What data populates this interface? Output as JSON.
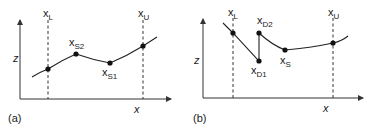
{
  "figure": {
    "panels": [
      {
        "id": "a",
        "caption": "(a)",
        "axis_y_label": "z",
        "axis_x_label": "x",
        "bounds": {
          "lower": {
            "base": "x",
            "sub": "L"
          },
          "upper": {
            "base": "x",
            "sub": "U"
          }
        },
        "points": [
          {
            "base": "x",
            "sub": "S2"
          },
          {
            "base": "x",
            "sub": "S1"
          }
        ]
      },
      {
        "id": "b",
        "caption": "(b)",
        "axis_y_label": "z",
        "axis_x_label": "x",
        "bounds": {
          "lower": {
            "base": "x",
            "sub": "L"
          },
          "upper": {
            "base": "x",
            "sub": "U"
          }
        },
        "points": [
          {
            "base": "x",
            "sub": "D2"
          },
          {
            "base": "x",
            "sub": "D1"
          },
          {
            "base": "x",
            "sub": "S"
          }
        ]
      }
    ]
  }
}
